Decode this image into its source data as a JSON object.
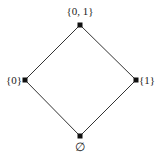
{
  "diagram": {
    "type": "hasse-diagram",
    "colors": {
      "line": "#333333",
      "node": "#111111",
      "text": "#222222",
      "background": "#ffffff"
    },
    "nodes": [
      {
        "id": "top",
        "label": "{0, 1}",
        "x": 80,
        "y": 25
      },
      {
        "id": "left",
        "label": "{0}",
        "x": 25,
        "y": 80
      },
      {
        "id": "right",
        "label": "{1}",
        "x": 136,
        "y": 80
      },
      {
        "id": "bottom",
        "label": "∅",
        "x": 80,
        "y": 136
      }
    ],
    "edges": [
      {
        "from": "bottom",
        "to": "left"
      },
      {
        "from": "bottom",
        "to": "right"
      },
      {
        "from": "left",
        "to": "top"
      },
      {
        "from": "right",
        "to": "top"
      }
    ]
  }
}
